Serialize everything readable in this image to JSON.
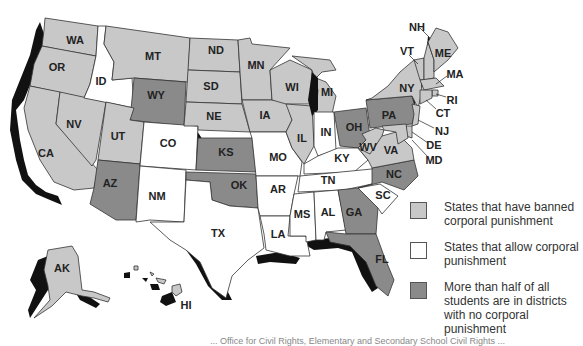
{
  "map": {
    "colors": {
      "banned": "#c8c8c8",
      "allow": "#ffffff",
      "half_no_corporal": "#8a8a8a",
      "shadow": "#111111"
    },
    "states": [
      {
        "abbr": "WA",
        "category": "banned"
      },
      {
        "abbr": "OR",
        "category": "banned"
      },
      {
        "abbr": "CA",
        "category": "banned"
      },
      {
        "abbr": "NV",
        "category": "banned"
      },
      {
        "abbr": "ID",
        "category": "allow"
      },
      {
        "abbr": "MT",
        "category": "banned"
      },
      {
        "abbr": "WY",
        "category": "half_no_corporal"
      },
      {
        "abbr": "UT",
        "category": "banned"
      },
      {
        "abbr": "AZ",
        "category": "half_no_corporal"
      },
      {
        "abbr": "CO",
        "category": "allow"
      },
      {
        "abbr": "NM",
        "category": "allow"
      },
      {
        "abbr": "ND",
        "category": "banned"
      },
      {
        "abbr": "SD",
        "category": "banned"
      },
      {
        "abbr": "NE",
        "category": "banned"
      },
      {
        "abbr": "KS",
        "category": "half_no_corporal"
      },
      {
        "abbr": "OK",
        "category": "half_no_corporal"
      },
      {
        "abbr": "TX",
        "category": "allow"
      },
      {
        "abbr": "MN",
        "category": "banned"
      },
      {
        "abbr": "IA",
        "category": "banned"
      },
      {
        "abbr": "MO",
        "category": "allow"
      },
      {
        "abbr": "AR",
        "category": "allow"
      },
      {
        "abbr": "LA",
        "category": "allow"
      },
      {
        "abbr": "WI",
        "category": "banned"
      },
      {
        "abbr": "IL",
        "category": "banned"
      },
      {
        "abbr": "MI",
        "category": "banned"
      },
      {
        "abbr": "IN",
        "category": "allow"
      },
      {
        "abbr": "KY",
        "category": "allow"
      },
      {
        "abbr": "TN",
        "category": "allow"
      },
      {
        "abbr": "MS",
        "category": "allow"
      },
      {
        "abbr": "AL",
        "category": "allow"
      },
      {
        "abbr": "OH",
        "category": "half_no_corporal"
      },
      {
        "abbr": "WV",
        "category": "banned"
      },
      {
        "abbr": "VA",
        "category": "banned"
      },
      {
        "abbr": "NC",
        "category": "half_no_corporal"
      },
      {
        "abbr": "SC",
        "category": "allow"
      },
      {
        "abbr": "GA",
        "category": "half_no_corporal"
      },
      {
        "abbr": "FL",
        "category": "half_no_corporal"
      },
      {
        "abbr": "PA",
        "category": "half_no_corporal"
      },
      {
        "abbr": "NY",
        "category": "banned"
      },
      {
        "abbr": "VT",
        "category": "banned"
      },
      {
        "abbr": "NH",
        "category": "banned"
      },
      {
        "abbr": "ME",
        "category": "banned"
      },
      {
        "abbr": "MA",
        "category": "banned"
      },
      {
        "abbr": "RI",
        "category": "banned"
      },
      {
        "abbr": "CT",
        "category": "banned"
      },
      {
        "abbr": "NJ",
        "category": "banned"
      },
      {
        "abbr": "DE",
        "category": "banned"
      },
      {
        "abbr": "MD",
        "category": "banned"
      },
      {
        "abbr": "AK",
        "category": "banned"
      },
      {
        "abbr": "HI",
        "category": "banned"
      }
    ],
    "labels": {
      "WA": "WA",
      "OR": "OR",
      "CA": "CA",
      "NV": "NV",
      "ID": "ID",
      "MT": "MT",
      "WY": "WY",
      "UT": "UT",
      "AZ": "AZ",
      "CO": "CO",
      "NM": "NM",
      "ND": "ND",
      "SD": "SD",
      "NE": "NE",
      "KS": "KS",
      "OK": "OK",
      "TX": "TX",
      "MN": "MN",
      "IA": "IA",
      "MO": "MO",
      "AR": "AR",
      "LA": "LA",
      "WI": "WI",
      "IL": "IL",
      "MI": "MI",
      "IN": "IN",
      "KY": "KY",
      "TN": "TN",
      "MS": "MS",
      "AL": "AL",
      "OH": "OH",
      "WV": "WV",
      "VA": "VA",
      "NC": "NC",
      "SC": "SC",
      "GA": "GA",
      "FL": "FL",
      "PA": "PA",
      "NY": "NY",
      "VT": "VT",
      "NH": "NH",
      "ME": "ME",
      "MA": "MA",
      "RI": "RI",
      "CT": "CT",
      "NJ": "NJ",
      "DE": "DE",
      "MD": "MD",
      "AK": "AK",
      "HI": "HI"
    }
  },
  "legend": {
    "items": [
      {
        "category": "banned",
        "label": "States that have banned corporal punishment"
      },
      {
        "category": "allow",
        "label": "States that allow corporal punishment"
      },
      {
        "category": "half_no_corporal",
        "label": "More than half of all students are in districts with no corporal punishment"
      }
    ]
  },
  "source": {
    "text": "... Office for Civil Rights, Elementary and Secondary School Civil Rights ..."
  }
}
